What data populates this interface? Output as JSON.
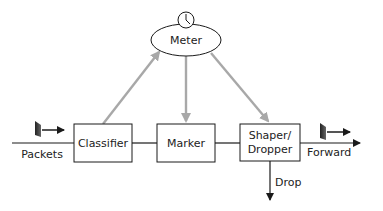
{
  "diagram": {
    "nodes": {
      "meter": {
        "label": "Meter",
        "icon": "clock-icon"
      },
      "classifier": {
        "label": "Classifier"
      },
      "marker": {
        "label": "Marker"
      },
      "shaper": {
        "line1": "Shaper/",
        "line2": "Dropper"
      }
    },
    "labels": {
      "packets": "Packets",
      "forward": "Forward",
      "drop": "Drop"
    },
    "colors": {
      "line": "#1a1a1a",
      "meter_arrow": "#a8a8a8",
      "packet_icon": "#333333"
    }
  }
}
